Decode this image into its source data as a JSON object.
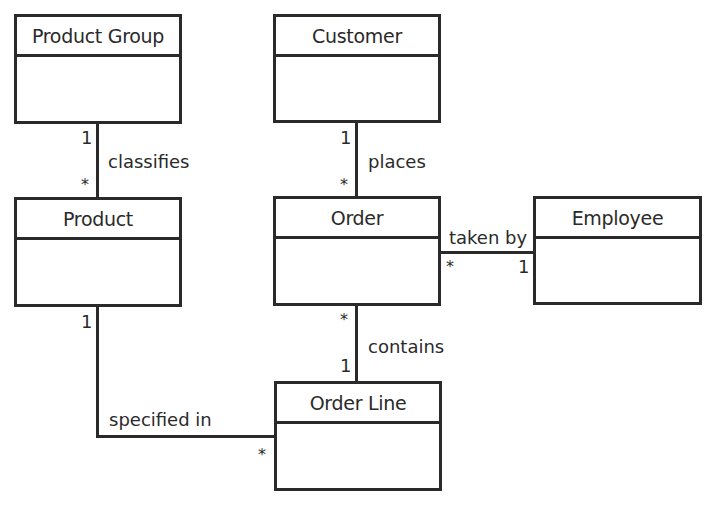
{
  "diagram": {
    "type": "uml-class-diagram",
    "classes": [
      {
        "id": "product-group",
        "name": "Product Group"
      },
      {
        "id": "customer",
        "name": "Customer"
      },
      {
        "id": "product",
        "name": "Product"
      },
      {
        "id": "order",
        "name": "Order"
      },
      {
        "id": "employee",
        "name": "Employee"
      },
      {
        "id": "order-line",
        "name": "Order Line"
      }
    ],
    "associations": [
      {
        "from": "Product Group",
        "to": "Product",
        "label": "classifies",
        "from_mult": "1",
        "to_mult": "*"
      },
      {
        "from": "Customer",
        "to": "Order",
        "label": "places",
        "from_mult": "1",
        "to_mult": "*"
      },
      {
        "from": "Order",
        "to": "Employee",
        "label": "taken by",
        "from_mult": "*",
        "to_mult": "1"
      },
      {
        "from": "Order",
        "to": "Order Line",
        "label": "contains",
        "from_mult": "*",
        "to_mult": "1"
      },
      {
        "from": "Product",
        "to": "Order Line",
        "label": "specified in",
        "from_mult": "1",
        "to_mult": "*"
      }
    ]
  }
}
